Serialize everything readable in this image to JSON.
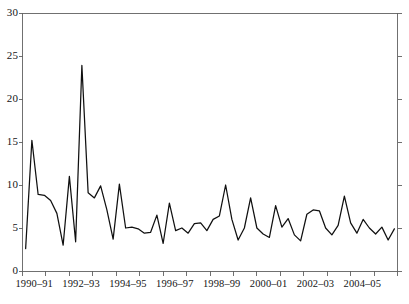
{
  "chart_data": {
    "type": "line",
    "title": "",
    "xlabel": "",
    "ylabel": "",
    "ylim": [
      0,
      30
    ],
    "yticks": [
      0,
      5,
      10,
      15,
      20,
      25,
      30
    ],
    "ytick_labels": [
      "0",
      "5",
      "10",
      "15",
      "20",
      "25",
      "30"
    ],
    "grid": false,
    "legend": "none",
    "x_axis_type": "category",
    "xtick_labels": [
      "1990–91",
      "1992–93",
      "1994–95",
      "1996–97",
      "1998–99",
      "2000–01",
      "2002–03",
      "2004–05"
    ],
    "xtick_positions_years": [
      1,
      3,
      5,
      7,
      9,
      11,
      13,
      15
    ],
    "n_points": 60,
    "series": [
      {
        "name": "series-1",
        "color": "#101010",
        "values": [
          2.6,
          15.2,
          8.9,
          8.8,
          8.2,
          6.7,
          3.0,
          11.0,
          3.4,
          23.9,
          9.1,
          8.5,
          9.9,
          7.1,
          3.7,
          10.1,
          5.0,
          5.1,
          4.9,
          4.4,
          4.5,
          6.5,
          3.2,
          7.9,
          4.7,
          5.0,
          4.4,
          5.5,
          5.6,
          4.7,
          6.0,
          6.4,
          10.0,
          6.0,
          3.6,
          5.0,
          8.5,
          5.0,
          4.3,
          3.9,
          7.6,
          5.1,
          6.1,
          4.2,
          3.5,
          6.6,
          7.1,
          7.0,
          5.0,
          4.2,
          5.3,
          8.7,
          5.6,
          4.4,
          6.0,
          5.0,
          4.3,
          5.1,
          3.6,
          4.9
        ]
      }
    ]
  },
  "axes": {
    "frame_color": "#606060",
    "line_color": "#101010"
  }
}
